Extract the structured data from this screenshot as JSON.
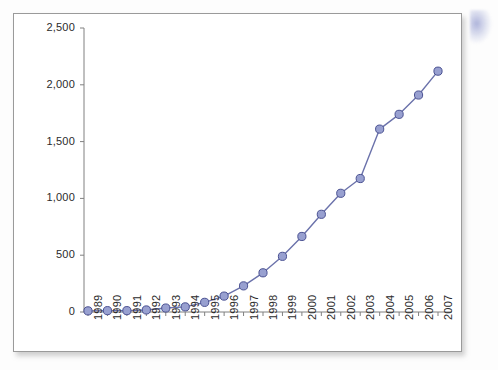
{
  "chart_data": {
    "type": "line",
    "title": "",
    "subtitle": "",
    "xlabel": "",
    "ylabel": "",
    "categories": [
      "1989",
      "1990",
      "1991",
      "1992",
      "1993",
      "1994",
      "1995",
      "1996",
      "1997",
      "1998",
      "1999",
      "2000",
      "2001",
      "2002",
      "2003",
      "2004",
      "2005",
      "2006",
      "2007"
    ],
    "values": [
      10,
      12,
      12,
      18,
      35,
      45,
      85,
      140,
      230,
      345,
      490,
      665,
      860,
      1045,
      1175,
      1610,
      1740,
      1910,
      2120
    ],
    "series": [
      {
        "name": "series-1",
        "values": [
          10,
          12,
          12,
          18,
          35,
          45,
          85,
          140,
          230,
          345,
          490,
          665,
          860,
          1045,
          1175,
          1610,
          1740,
          1910,
          2120
        ]
      }
    ],
    "ylim": [
      0,
      2500
    ],
    "yticks": [
      0,
      500,
      1000,
      1500,
      2000,
      2500
    ],
    "ytick_labels": [
      "0",
      "500",
      "1,000",
      "1,500",
      "2,000",
      "2,500"
    ],
    "xtick_labels": [
      "1989",
      "1990",
      "1991",
      "1992",
      "1993",
      "1994",
      "1995",
      "1996",
      "1997",
      "1998",
      "1999",
      "2000",
      "2001",
      "2002",
      "2003",
      "2004",
      "2005",
      "2006",
      "2007"
    ],
    "grid": false,
    "legend": "none",
    "marker": "circle",
    "line_color": "#6b72ab",
    "marker_fill": "#98a0d0",
    "marker_stroke": "#4a5192",
    "axis_color": "#808080",
    "text_color": "#2b2b2b",
    "background": "#ffffff"
  },
  "figure": {
    "card_background": "#ffffff",
    "card_border_color": "#9a9a9a",
    "page_background": "#fdfdfd"
  }
}
